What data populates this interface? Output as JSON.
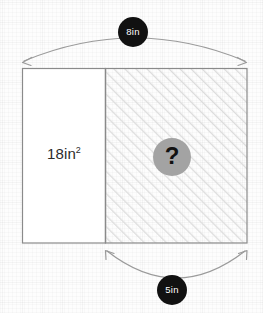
{
  "figure": {
    "background_color": "#fdfdfd",
    "grid_color": "#f0f0f0",
    "outline_color": "#8a8a8a",
    "hatch_color": "#dcdcdc",
    "badge_color": "#111111",
    "badge_text_color": "#ffffff",
    "question_circle_color": "#a3a3a3",
    "question_mark_color": "#111111"
  },
  "dimensions": {
    "top": {
      "label": "8in",
      "icon": "double-arrow-arc-icon",
      "spans": "full-width"
    },
    "bottom": {
      "label": "5in",
      "icon": "double-arrow-arc-icon",
      "spans": "hatched-region-width"
    }
  },
  "regions": {
    "left": {
      "label_text": "18in",
      "label_exponent": "2",
      "fill": "plain"
    },
    "right": {
      "label": "?",
      "fill": "diagonal-hatch"
    }
  }
}
